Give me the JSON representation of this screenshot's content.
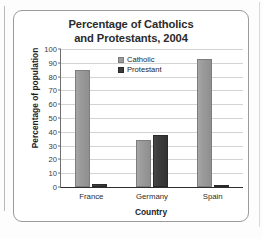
{
  "chart_data": {
    "type": "bar",
    "title": "Percentage of Catholics and Protestants, 2004",
    "title_line1": "Percentage of Catholics",
    "title_line2": "and Protestants, 2004",
    "xlabel": "Country",
    "ylabel": "Percentage of population",
    "categories": [
      "France",
      "Germany",
      "Spain"
    ],
    "series": [
      {
        "name": "Catholic",
        "color": "#9b9b9b",
        "values": [
          85,
          34,
          93
        ]
      },
      {
        "name": "Protestant",
        "color": "#3b3b3b",
        "values": [
          2,
          38,
          1
        ]
      }
    ],
    "ylim": [
      0,
      100
    ],
    "yticks": [
      0,
      10,
      20,
      30,
      40,
      50,
      60,
      70,
      80,
      90,
      100
    ],
    "ytick_labels": [
      "0",
      "10",
      "20",
      "30",
      "40",
      "50",
      "60",
      "70",
      "80",
      "90",
      "100"
    ],
    "grid": true,
    "legend_position": "top-center"
  },
  "legend": {
    "items": [
      {
        "label": "Catholic",
        "swatch": "catholic"
      },
      {
        "label": "Protestant",
        "swatch": "protestant"
      }
    ]
  }
}
